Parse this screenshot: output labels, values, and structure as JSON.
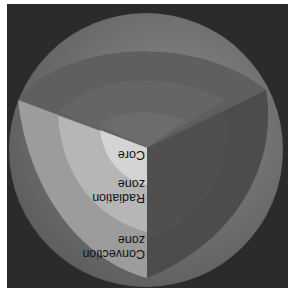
{
  "figure": {
    "orientation": "upside-down",
    "labels": {
      "core": "Core",
      "radiation_line1": "Radiation",
      "radiation_line2": "zone",
      "convection_line1": "Convection",
      "convection_line2": "zone"
    },
    "colors": {
      "background": "#2b2b2b",
      "surface": "#7a7a7a",
      "top_face": "#5e5e5e",
      "right_face": "#4c4c4c",
      "convection_face": "#9a9a9a",
      "radiation_face": "#b8b8b8",
      "core_face": "#d6d6d6",
      "text": "#111111"
    }
  }
}
